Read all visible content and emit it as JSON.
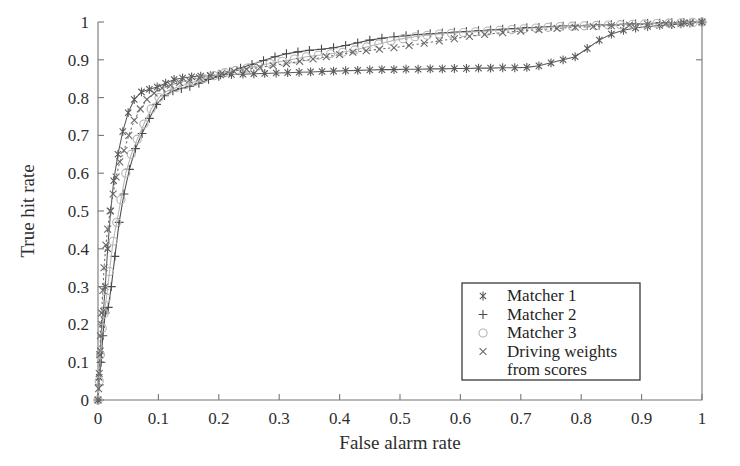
{
  "chart_data": {
    "type": "line",
    "title": "",
    "xlabel": "False alarm rate",
    "ylabel": "True hit rate",
    "xlim": [
      0,
      1
    ],
    "ylim": [
      0,
      1
    ],
    "grid": false,
    "legend_position": "lower-right",
    "xticks": [
      "0",
      "0.1",
      "0.2",
      "0.3",
      "0.4",
      "0.5",
      "0.6",
      "0.7",
      "0.8",
      "0.9",
      "1"
    ],
    "xtick_values": [
      0,
      0.1,
      0.2,
      0.3,
      0.4,
      0.5,
      0.6,
      0.7,
      0.8,
      0.9,
      1
    ],
    "yticks": [
      "0",
      "0.1",
      "0.2",
      "0.3",
      "0.4",
      "0.5",
      "0.6",
      "0.7",
      "0.8",
      "0.9",
      "1"
    ],
    "ytick_values": [
      0,
      0.1,
      0.2,
      0.3,
      0.4,
      0.5,
      0.6,
      0.7,
      0.8,
      0.9,
      1
    ],
    "series": [
      {
        "name": "Matcher 1",
        "marker": "asterisk",
        "linestyle": "solid",
        "color": "#5a5a5a",
        "x": [
          0.0,
          0.002,
          0.004,
          0.006,
          0.009,
          0.012,
          0.016,
          0.021,
          0.026,
          0.033,
          0.041,
          0.05,
          0.06,
          0.072,
          0.085,
          0.098,
          0.112,
          0.126,
          0.14,
          0.155,
          0.17,
          0.186,
          0.203,
          0.221,
          0.24,
          0.258,
          0.276,
          0.295,
          0.314,
          0.333,
          0.352,
          0.371,
          0.39,
          0.41,
          0.43,
          0.45,
          0.47,
          0.49,
          0.51,
          0.53,
          0.55,
          0.57,
          0.59,
          0.61,
          0.63,
          0.65,
          0.67,
          0.69,
          0.71,
          0.73,
          0.75,
          0.77,
          0.79,
          0.81,
          0.83,
          0.85,
          0.87,
          0.89,
          0.91,
          0.93,
          0.95,
          0.965,
          0.98,
          1.0
        ],
        "y": [
          0.0,
          0.06,
          0.13,
          0.2,
          0.235,
          0.3,
          0.4,
          0.5,
          0.58,
          0.65,
          0.71,
          0.76,
          0.795,
          0.815,
          0.822,
          0.828,
          0.838,
          0.848,
          0.852,
          0.855,
          0.857,
          0.858,
          0.86,
          0.861,
          0.862,
          0.863,
          0.864,
          0.865,
          0.866,
          0.867,
          0.868,
          0.869,
          0.87,
          0.871,
          0.872,
          0.873,
          0.874,
          0.874,
          0.875,
          0.875,
          0.876,
          0.876,
          0.877,
          0.877,
          0.878,
          0.878,
          0.879,
          0.879,
          0.88,
          0.884,
          0.892,
          0.9,
          0.908,
          0.93,
          0.952,
          0.968,
          0.978,
          0.984,
          0.988,
          0.991,
          0.993,
          0.995,
          0.997,
          1.0
        ]
      },
      {
        "name": "Matcher 2",
        "marker": "plus",
        "linestyle": "solid",
        "color": "#4a4a4a",
        "x": [
          0.0,
          0.002,
          0.005,
          0.008,
          0.012,
          0.017,
          0.022,
          0.028,
          0.035,
          0.043,
          0.052,
          0.062,
          0.073,
          0.085,
          0.097,
          0.11,
          0.124,
          0.138,
          0.152,
          0.167,
          0.183,
          0.2,
          0.218,
          0.236,
          0.255,
          0.274,
          0.293,
          0.312,
          0.331,
          0.35,
          0.37,
          0.39,
          0.41,
          0.43,
          0.45,
          0.47,
          0.49,
          0.51,
          0.53,
          0.55,
          0.57,
          0.59,
          0.61,
          0.63,
          0.65,
          0.67,
          0.69,
          0.71,
          0.73,
          0.75,
          0.77,
          0.79,
          0.81,
          0.83,
          0.85,
          0.87,
          0.89,
          0.91,
          0.93,
          0.95,
          0.97,
          0.985,
          1.0
        ],
        "y": [
          0.0,
          0.04,
          0.1,
          0.17,
          0.23,
          0.245,
          0.3,
          0.38,
          0.47,
          0.545,
          0.61,
          0.665,
          0.705,
          0.745,
          0.782,
          0.805,
          0.818,
          0.824,
          0.83,
          0.838,
          0.848,
          0.856,
          0.868,
          0.878,
          0.888,
          0.898,
          0.908,
          0.916,
          0.921,
          0.925,
          0.928,
          0.932,
          0.938,
          0.945,
          0.952,
          0.957,
          0.961,
          0.964,
          0.967,
          0.969,
          0.971,
          0.973,
          0.975,
          0.977,
          0.979,
          0.981,
          0.983,
          0.985,
          0.986,
          0.988,
          0.989,
          0.99,
          0.991,
          0.992,
          0.993,
          0.994,
          0.995,
          0.996,
          0.997,
          0.998,
          0.999,
          0.999,
          1.0
        ]
      },
      {
        "name": "Matcher 3",
        "marker": "circle",
        "linestyle": "solid",
        "color": "#b5b5b5",
        "x": [
          0.0,
          0.002,
          0.004,
          0.007,
          0.01,
          0.014,
          0.019,
          0.025,
          0.031,
          0.038,
          0.046,
          0.055,
          0.065,
          0.076,
          0.088,
          0.101,
          0.115,
          0.129,
          0.144,
          0.159,
          0.175,
          0.192,
          0.21,
          0.228,
          0.247,
          0.266,
          0.285,
          0.305,
          0.325,
          0.345,
          0.365,
          0.385,
          0.405,
          0.425,
          0.445,
          0.465,
          0.485,
          0.505,
          0.525,
          0.545,
          0.565,
          0.585,
          0.605,
          0.625,
          0.645,
          0.665,
          0.685,
          0.705,
          0.725,
          0.745,
          0.765,
          0.785,
          0.805,
          0.825,
          0.845,
          0.865,
          0.885,
          0.905,
          0.925,
          0.945,
          0.965,
          0.985,
          1.0
        ],
        "y": [
          0.0,
          0.05,
          0.12,
          0.19,
          0.228,
          0.27,
          0.34,
          0.42,
          0.47,
          0.53,
          0.6,
          0.65,
          0.69,
          0.73,
          0.77,
          0.8,
          0.818,
          0.826,
          0.834,
          0.842,
          0.85,
          0.858,
          0.866,
          0.872,
          0.878,
          0.884,
          0.89,
          0.896,
          0.902,
          0.908,
          0.912,
          0.916,
          0.92,
          0.926,
          0.934,
          0.942,
          0.95,
          0.956,
          0.961,
          0.965,
          0.968,
          0.97,
          0.972,
          0.974,
          0.976,
          0.978,
          0.98,
          0.982,
          0.984,
          0.986,
          0.988,
          0.989,
          0.99,
          0.991,
          0.992,
          0.993,
          0.994,
          0.995,
          0.996,
          0.997,
          0.998,
          0.999,
          1.0
        ]
      },
      {
        "name": "Driving weights from scores",
        "marker": "cross",
        "linestyle": "dotted",
        "color": "#6a6a6a",
        "x": [
          0.0,
          0.001,
          0.002,
          0.003,
          0.004,
          0.006,
          0.008,
          0.01,
          0.013,
          0.016,
          0.02,
          0.025,
          0.03,
          0.036,
          0.043,
          0.051,
          0.06,
          0.07,
          0.081,
          0.093,
          0.106,
          0.12,
          0.135,
          0.151,
          0.168,
          0.186,
          0.205,
          0.225,
          0.246,
          0.268,
          0.29,
          0.312,
          0.334,
          0.356,
          0.378,
          0.4,
          0.422,
          0.444,
          0.466,
          0.49,
          0.515,
          0.54,
          0.565,
          0.59,
          0.615,
          0.64,
          0.67,
          0.7,
          0.73,
          0.76,
          0.79,
          0.82,
          0.85,
          0.88,
          0.91,
          0.94,
          0.97,
          1.0
        ],
        "y": [
          0.0,
          0.03,
          0.07,
          0.12,
          0.17,
          0.23,
          0.29,
          0.35,
          0.41,
          0.452,
          0.5,
          0.545,
          0.59,
          0.63,
          0.66,
          0.7,
          0.74,
          0.77,
          0.795,
          0.812,
          0.825,
          0.833,
          0.84,
          0.846,
          0.852,
          0.858,
          0.864,
          0.87,
          0.875,
          0.88,
          0.885,
          0.89,
          0.896,
          0.902,
          0.908,
          0.914,
          0.92,
          0.924,
          0.928,
          0.932,
          0.938,
          0.944,
          0.95,
          0.956,
          0.962,
          0.967,
          0.972,
          0.976,
          0.98,
          0.983,
          0.986,
          0.988,
          0.99,
          0.992,
          0.994,
          0.996,
          0.998,
          1.0
        ]
      }
    ],
    "legend_entries": [
      {
        "label": "Matcher 1",
        "marker": "asterisk"
      },
      {
        "label": "Matcher 2",
        "marker": "plus"
      },
      {
        "label": "Matcher 3",
        "marker": "circle"
      },
      {
        "label": "Driving weights",
        "marker": "cross"
      },
      {
        "label": "from scores",
        "marker": "none"
      }
    ]
  }
}
